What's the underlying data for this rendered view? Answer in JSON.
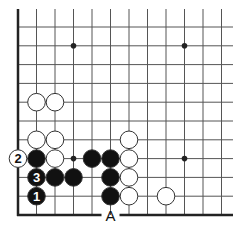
{
  "diagram": {
    "type": "go-board-fragment",
    "colors": {
      "background": "#ffffff",
      "line": "#555555",
      "edge": "#222222",
      "black_stone": "#111111",
      "white_stone": "#ffffff",
      "stone_outline": "#333333"
    },
    "grid": {
      "origin_x": 18,
      "origin_y": 27,
      "spacing_x": 18.5,
      "spacing_y": 18.8,
      "columns": 12,
      "rows": 11,
      "top_extend_y": 9,
      "right_extend_x": 233,
      "left_edge": true,
      "bottom_edge": true
    },
    "star_points": [
      {
        "col": 3,
        "row": 1
      },
      {
        "col": 9,
        "row": 1
      },
      {
        "col": 3,
        "row": 7
      },
      {
        "col": 9,
        "row": 7
      }
    ],
    "stones": [
      {
        "color": "white",
        "col": 1,
        "row": 4,
        "label": ""
      },
      {
        "color": "white",
        "col": 2,
        "row": 4,
        "label": ""
      },
      {
        "color": "white",
        "col": 1,
        "row": 6,
        "label": ""
      },
      {
        "color": "white",
        "col": 2,
        "row": 6,
        "label": ""
      },
      {
        "color": "white",
        "col": 2,
        "row": 7,
        "label": ""
      },
      {
        "color": "white",
        "col": 0,
        "row": 7,
        "label": "2"
      },
      {
        "color": "black",
        "col": 1,
        "row": 7,
        "label": ""
      },
      {
        "color": "black",
        "col": 1,
        "row": 8,
        "label": "3"
      },
      {
        "color": "black",
        "col": 2,
        "row": 8,
        "label": ""
      },
      {
        "color": "black",
        "col": 3,
        "row": 8,
        "label": ""
      },
      {
        "color": "black",
        "col": 1,
        "row": 9,
        "label": "1"
      },
      {
        "color": "black",
        "col": 4,
        "row": 7,
        "label": ""
      },
      {
        "color": "black",
        "col": 5,
        "row": 7,
        "label": ""
      },
      {
        "color": "black",
        "col": 5,
        "row": 8,
        "label": ""
      },
      {
        "color": "black",
        "col": 5,
        "row": 9,
        "label": ""
      },
      {
        "color": "white",
        "col": 6,
        "row": 6,
        "label": ""
      },
      {
        "color": "white",
        "col": 6,
        "row": 7,
        "label": ""
      },
      {
        "color": "white",
        "col": 6,
        "row": 8,
        "label": ""
      },
      {
        "color": "white",
        "col": 6,
        "row": 9,
        "label": ""
      },
      {
        "color": "white",
        "col": 8,
        "row": 9,
        "label": ""
      }
    ],
    "edge_labels": [
      {
        "text": "A",
        "col": 5,
        "position": "bottom-edge"
      }
    ]
  }
}
